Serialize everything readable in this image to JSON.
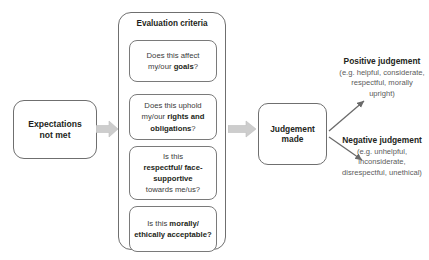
{
  "diagram": {
    "colors": {
      "node_border": "#6f6f6f",
      "card_border": "#7a7a7a",
      "text_primary": "#231f20",
      "text_secondary": "#5b5b5b",
      "arrow_block": "#c9c9c9",
      "arrow_line": "#6a6a6a",
      "background": "#ffffff"
    }
  },
  "start": {
    "label_line1": "Expectations",
    "label_line2": "not met"
  },
  "criteria": {
    "title": "Evaluation criteria",
    "items": [
      {
        "name": "goals",
        "lead": "Does this affect",
        "mid": "my/our ",
        "emphasis": "goals",
        "tail": "?"
      },
      {
        "name": "rights-and-obligations",
        "lead": "Does this uphold",
        "mid": "my/our ",
        "emphasis": "rights and obligations",
        "tail": "?"
      },
      {
        "name": "respectful-face-supportive",
        "lead": "Is this",
        "mid": "",
        "emphasis": "respectful/ face-supportive",
        "tail": " towards me/us?"
      },
      {
        "name": "morally-ethically-acceptable",
        "lead": "Is this ",
        "mid": "",
        "emphasis": "morally/ ethically acceptable?",
        "tail": ""
      }
    ]
  },
  "judgement": {
    "label_line1": "Judgement",
    "label_line2": "made"
  },
  "outcomes": [
    {
      "name": "positive",
      "head": "Positive judgement",
      "detail": "(e.g. helpful, considerate, respectful, morally upright)"
    },
    {
      "name": "negative",
      "head": "Negative judgement",
      "detail": "(e.g. unhelpful, inconsiderate, disrespectful, unethical)"
    }
  ],
  "connectors": [
    {
      "name": "start-to-criteria",
      "style": "block-arrow",
      "direction": "right"
    },
    {
      "name": "criteria-to-judgement",
      "style": "block-arrow",
      "direction": "right"
    },
    {
      "name": "judgement-to-positive",
      "style": "line-arrow",
      "direction": "up-right"
    },
    {
      "name": "judgement-to-negative",
      "style": "line-arrow",
      "direction": "down-right"
    }
  ]
}
